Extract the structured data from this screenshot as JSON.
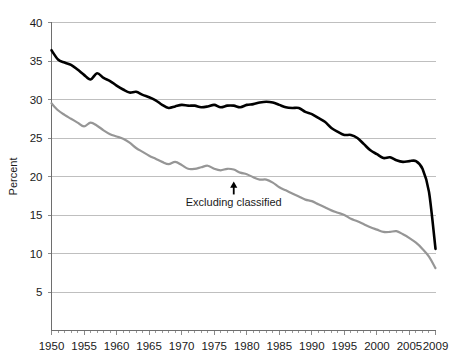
{
  "chart_data": {
    "type": "line",
    "title": "",
    "subtitle": "",
    "xlabel": "",
    "ylabel": "Percent",
    "xlim": [
      1950,
      2009
    ],
    "ylim": [
      0,
      40
    ],
    "ytick_labels": [
      "40",
      "35",
      "30",
      "25",
      "20",
      "15",
      "10",
      "5"
    ],
    "yticks": [
      40,
      35,
      30,
      25,
      20,
      15,
      10,
      5
    ],
    "xtick_labels": [
      "1950",
      "1955",
      "1960",
      "1965",
      "1970",
      "1975",
      "1980",
      "1985",
      "1990",
      "1995",
      "2000",
      "2005",
      "2009"
    ],
    "xticks": [
      1950,
      1955,
      1960,
      1965,
      1970,
      1975,
      1980,
      1985,
      1990,
      1995,
      2000,
      2005,
      2009
    ],
    "grid": true,
    "legend": "none",
    "annotations": [
      {
        "text": "Excluding classified",
        "x": 1978,
        "y": 16.5,
        "arrow": true,
        "arrow_target_x": 1978,
        "arrow_target_y": 19.6
      }
    ],
    "x": [
      1950,
      1951,
      1952,
      1953,
      1954,
      1955,
      1956,
      1957,
      1958,
      1959,
      1960,
      1961,
      1962,
      1963,
      1964,
      1965,
      1966,
      1967,
      1968,
      1969,
      1970,
      1971,
      1972,
      1973,
      1974,
      1975,
      1976,
      1977,
      1978,
      1979,
      1980,
      1981,
      1982,
      1983,
      1984,
      1985,
      1986,
      1987,
      1988,
      1989,
      1990,
      1991,
      1992,
      1993,
      1994,
      1995,
      1996,
      1997,
      1998,
      1999,
      2000,
      2001,
      2002,
      2003,
      2004,
      2005,
      2006,
      2007,
      2008,
      2009
    ],
    "series": [
      {
        "name": "Total",
        "color": "#000000",
        "width": 2.6,
        "values": [
          36.4,
          35.2,
          34.8,
          34.5,
          33.9,
          33.2,
          32.6,
          33.4,
          32.8,
          32.4,
          31.8,
          31.3,
          30.9,
          31.0,
          30.6,
          30.3,
          29.9,
          29.3,
          28.9,
          29.1,
          29.3,
          29.2,
          29.2,
          29.0,
          29.1,
          29.3,
          29.0,
          29.2,
          29.2,
          29.0,
          29.3,
          29.4,
          29.6,
          29.7,
          29.6,
          29.3,
          29.0,
          28.9,
          28.9,
          28.4,
          28.1,
          27.6,
          27.1,
          26.3,
          25.8,
          25.4,
          25.4,
          25.0,
          24.2,
          23.4,
          22.9,
          22.4,
          22.5,
          22.1,
          21.9,
          22.0,
          22.0,
          21.0,
          18.0,
          10.6
        ]
      },
      {
        "name": "Excluding classified",
        "color": "#969696",
        "width": 2.2,
        "values": [
          29.5,
          28.6,
          28.0,
          27.5,
          27.0,
          26.5,
          27.0,
          26.6,
          26.0,
          25.5,
          25.2,
          24.9,
          24.4,
          23.7,
          23.2,
          22.7,
          22.3,
          21.9,
          21.6,
          21.9,
          21.5,
          21.0,
          21.0,
          21.2,
          21.4,
          21.0,
          20.8,
          21.0,
          20.9,
          20.5,
          20.3,
          19.9,
          19.6,
          19.6,
          19.2,
          18.6,
          18.2,
          17.8,
          17.4,
          17.0,
          16.8,
          16.4,
          16.0,
          15.6,
          15.3,
          15.0,
          14.5,
          14.2,
          13.8,
          13.4,
          13.1,
          12.8,
          12.8,
          12.9,
          12.5,
          12.0,
          11.4,
          10.6,
          9.6,
          8.1
        ]
      }
    ]
  },
  "axes": {
    "y_title": "Percent"
  }
}
